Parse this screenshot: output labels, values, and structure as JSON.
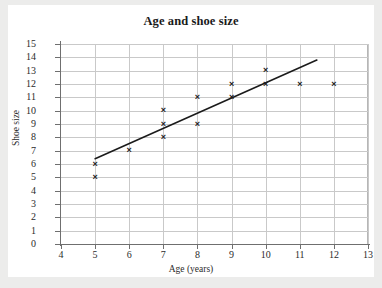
{
  "chart_data": {
    "type": "scatter",
    "title": "Age and shoe size",
    "xlabel": "Age (years)",
    "ylabel": "Shoe size",
    "xlim": [
      4,
      13
    ],
    "ylim": [
      0,
      15
    ],
    "grid": true,
    "legend": null,
    "x_ticks": [
      "4",
      "5",
      "6",
      "7",
      "8",
      "9",
      "10",
      "11",
      "12",
      "13"
    ],
    "y_ticks": [
      "0",
      "1",
      "2",
      "3",
      "4",
      "5",
      "6",
      "7",
      "8",
      "9",
      "10",
      "11",
      "12",
      "13",
      "14",
      "15"
    ],
    "marker_symbol": "×",
    "marker_color": "#1b1b1b",
    "points": [
      {
        "x": 5,
        "y": 6
      },
      {
        "x": 5,
        "y": 5
      },
      {
        "x": 6,
        "y": 7
      },
      {
        "x": 7,
        "y": 10
      },
      {
        "x": 7,
        "y": 9
      },
      {
        "x": 7,
        "y": 8
      },
      {
        "x": 8,
        "y": 11
      },
      {
        "x": 8,
        "y": 9
      },
      {
        "x": 9,
        "y": 12
      },
      {
        "x": 9,
        "y": 11
      },
      {
        "x": 10,
        "y": 13
      },
      {
        "x": 10,
        "y": 12
      },
      {
        "x": 11,
        "y": 12
      },
      {
        "x": 12,
        "y": 12
      }
    ],
    "trendline": {
      "label": "line of best fit",
      "color": "#1b1b1b",
      "x_start": 5.0,
      "y_start": 6.4,
      "x_end": 11.5,
      "y_end": 13.8
    }
  },
  "colors": {
    "page_background": "#ececeb",
    "card_background": "#ffffff",
    "gridline": "#c9c9c9",
    "axis": "#6f6f6f",
    "text": "#2b2b2b",
    "title": "#1a1a1a"
  }
}
